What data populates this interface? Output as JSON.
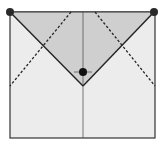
{
  "diagram": {
    "type": "fold-diagram",
    "colors": {
      "background": "#ffffff",
      "paper": "#ececec",
      "shaded_flap": "#cfcfcf",
      "lines": "#222222",
      "dots": "#111111"
    },
    "square": {
      "x": 10,
      "y": 12,
      "w": 145,
      "h": 126
    },
    "shaded_triangle": [
      [
        10,
        12
      ],
      [
        154,
        12
      ],
      [
        83,
        86
      ]
    ],
    "solid_lines": [
      {
        "name": "left-diagonal",
        "from": [
          10,
          12
        ],
        "to": [
          83,
          86
        ]
      },
      {
        "name": "right-diagonal",
        "from": [
          154,
          12
        ],
        "to": [
          83,
          86
        ]
      },
      {
        "name": "center-vertical",
        "from": [
          83,
          12
        ],
        "to": [
          83,
          138
        ]
      }
    ],
    "dashed_lines": [
      {
        "name": "left-dashed",
        "from": [
          71,
          12
        ],
        "to": [
          10,
          86
        ]
      },
      {
        "name": "right-dashed",
        "from": [
          95,
          12
        ],
        "to": [
          155,
          86
        ]
      }
    ],
    "dots": [
      {
        "name": "top-left-dot",
        "cx": 10,
        "cy": 12,
        "r": 4
      },
      {
        "name": "top-right-dot",
        "cx": 154,
        "cy": 12,
        "r": 4
      },
      {
        "name": "center-dot",
        "cx": 83,
        "cy": 72,
        "r": 4
      }
    ]
  }
}
